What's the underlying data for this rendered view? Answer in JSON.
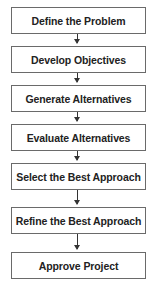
{
  "diagram": {
    "type": "flowchart",
    "direction": "top-to-bottom",
    "steps": [
      {
        "label": "Define the Problem"
      },
      {
        "label": "Develop Objectives"
      },
      {
        "label": "Generate Alternatives"
      },
      {
        "label": "Evaluate Alternatives"
      },
      {
        "label": "Select the Best Approach"
      },
      {
        "label": "Refine the Best Approach"
      },
      {
        "label": "Approve Project"
      }
    ],
    "colors": {
      "border": "#6a6a6a",
      "text": "#222222",
      "arrow": "#333333",
      "background": "#ffffff"
    }
  }
}
